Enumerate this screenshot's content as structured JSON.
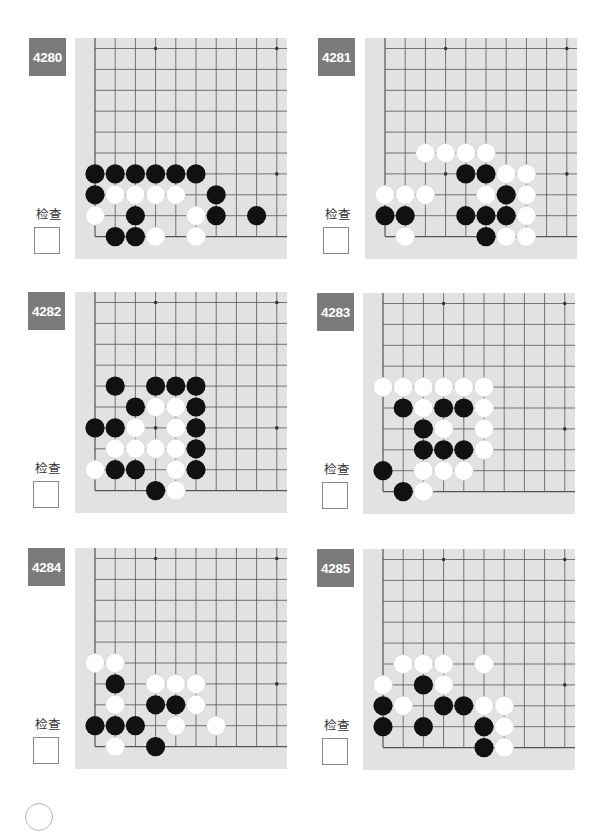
{
  "page": {
    "check_label": "检查",
    "colors": {
      "badge": "#7b7b7b",
      "board": "#e2e2e2",
      "grid_line": "#555555",
      "black_stone": "#111111",
      "white_stone": "#ffffff"
    }
  },
  "problems": [
    {
      "number": "4280",
      "check_label": "检查",
      "stars": [
        [
          3,
          0
        ],
        [
          9,
          0
        ],
        [
          9,
          6
        ]
      ],
      "black": [
        [
          0,
          6
        ],
        [
          1,
          6
        ],
        [
          2,
          6
        ],
        [
          3,
          6
        ],
        [
          4,
          6
        ],
        [
          5,
          6
        ],
        [
          0,
          7
        ],
        [
          6,
          7
        ],
        [
          2,
          8
        ],
        [
          6,
          8
        ],
        [
          8,
          8
        ],
        [
          1,
          9
        ],
        [
          2,
          9
        ]
      ],
      "white": [
        [
          1,
          7
        ],
        [
          2,
          7
        ],
        [
          3,
          7
        ],
        [
          4,
          7
        ],
        [
          0,
          8
        ],
        [
          5,
          8
        ],
        [
          3,
          9
        ],
        [
          5,
          9
        ]
      ]
    },
    {
      "number": "4281",
      "check_label": "检查",
      "stars": [
        [
          3,
          0
        ],
        [
          9,
          0
        ],
        [
          3,
          6
        ],
        [
          9,
          6
        ]
      ],
      "black": [
        [
          4,
          6
        ],
        [
          5,
          6
        ],
        [
          6,
          7
        ],
        [
          0,
          8
        ],
        [
          1,
          8
        ],
        [
          4,
          8
        ],
        [
          5,
          8
        ],
        [
          6,
          8
        ],
        [
          5,
          9
        ]
      ],
      "white": [
        [
          2,
          5
        ],
        [
          3,
          5
        ],
        [
          4,
          5
        ],
        [
          5,
          5
        ],
        [
          6,
          6
        ],
        [
          7,
          6
        ],
        [
          0,
          7
        ],
        [
          1,
          7
        ],
        [
          2,
          7
        ],
        [
          5,
          7
        ],
        [
          7,
          7
        ],
        [
          7,
          8
        ],
        [
          1,
          9
        ],
        [
          6,
          9
        ],
        [
          7,
          9
        ]
      ]
    },
    {
      "number": "4282",
      "check_label": "检查",
      "stars": [
        [
          3,
          0
        ],
        [
          9,
          0
        ],
        [
          3,
          6
        ],
        [
          9,
          6
        ]
      ],
      "black": [
        [
          1,
          4
        ],
        [
          3,
          4
        ],
        [
          4,
          4
        ],
        [
          5,
          4
        ],
        [
          2,
          5
        ],
        [
          5,
          5
        ],
        [
          0,
          6
        ],
        [
          1,
          6
        ],
        [
          5,
          6
        ],
        [
          5,
          7
        ],
        [
          1,
          8
        ],
        [
          2,
          8
        ],
        [
          5,
          8
        ],
        [
          3,
          9
        ]
      ],
      "white": [
        [
          3,
          5
        ],
        [
          4,
          5
        ],
        [
          2,
          6
        ],
        [
          4,
          6
        ],
        [
          1,
          7
        ],
        [
          2,
          7
        ],
        [
          3,
          7
        ],
        [
          4,
          7
        ],
        [
          0,
          8
        ],
        [
          4,
          8
        ],
        [
          4,
          9
        ]
      ]
    },
    {
      "number": "4283",
      "check_label": "检查",
      "stars": [
        [
          3,
          0
        ],
        [
          9,
          0
        ],
        [
          9,
          6
        ]
      ],
      "black": [
        [
          1,
          5
        ],
        [
          3,
          5
        ],
        [
          4,
          5
        ],
        [
          2,
          6
        ],
        [
          2,
          7
        ],
        [
          3,
          7
        ],
        [
          4,
          7
        ],
        [
          0,
          8
        ],
        [
          1,
          9
        ]
      ],
      "white": [
        [
          0,
          4
        ],
        [
          1,
          4
        ],
        [
          2,
          4
        ],
        [
          3,
          4
        ],
        [
          4,
          4
        ],
        [
          5,
          4
        ],
        [
          2,
          5
        ],
        [
          5,
          5
        ],
        [
          3,
          6
        ],
        [
          5,
          6
        ],
        [
          5,
          7
        ],
        [
          2,
          8
        ],
        [
          3,
          8
        ],
        [
          4,
          8
        ],
        [
          2,
          9
        ]
      ]
    },
    {
      "number": "4284",
      "check_label": "检查",
      "stars": [
        [
          3,
          0
        ],
        [
          9,
          0
        ],
        [
          9,
          6
        ]
      ],
      "black": [
        [
          1,
          6
        ],
        [
          3,
          7
        ],
        [
          4,
          7
        ],
        [
          0,
          8
        ],
        [
          1,
          8
        ],
        [
          2,
          8
        ],
        [
          3,
          9
        ]
      ],
      "white": [
        [
          0,
          5
        ],
        [
          1,
          5
        ],
        [
          3,
          6
        ],
        [
          4,
          6
        ],
        [
          5,
          6
        ],
        [
          1,
          7
        ],
        [
          5,
          7
        ],
        [
          4,
          8
        ],
        [
          6,
          8
        ],
        [
          1,
          9
        ]
      ]
    },
    {
      "number": "4285",
      "check_label": "检查",
      "stars": [
        [
          3,
          0
        ],
        [
          9,
          0
        ],
        [
          9,
          6
        ]
      ],
      "black": [
        [
          2,
          6
        ],
        [
          0,
          7
        ],
        [
          3,
          7
        ],
        [
          4,
          7
        ],
        [
          0,
          8
        ],
        [
          2,
          8
        ],
        [
          5,
          8
        ],
        [
          5,
          9
        ]
      ],
      "white": [
        [
          1,
          5
        ],
        [
          2,
          5
        ],
        [
          3,
          5
        ],
        [
          5,
          5
        ],
        [
          0,
          6
        ],
        [
          3,
          6
        ],
        [
          1,
          7
        ],
        [
          5,
          7
        ],
        [
          6,
          7
        ],
        [
          6,
          8
        ],
        [
          6,
          9
        ]
      ]
    }
  ]
}
